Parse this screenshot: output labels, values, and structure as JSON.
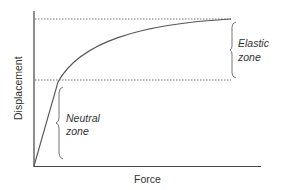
{
  "diagram": {
    "type": "force-displacement curve",
    "axes": {
      "x_label": "Force",
      "y_label": "Displacement"
    },
    "zones": [
      {
        "name": "neutral",
        "label_line1": "Neutral",
        "label_line2": "zone"
      },
      {
        "name": "elastic",
        "label_line1": "Elastic",
        "label_line2": "zone"
      }
    ],
    "colors": {
      "axis": "#444444",
      "curve": "#555555",
      "dotted": "#666666",
      "brace": "#666666",
      "text": "#333333"
    }
  }
}
